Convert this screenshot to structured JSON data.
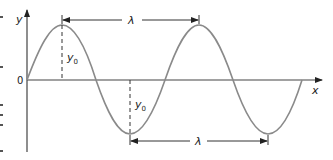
{
  "diagram": {
    "type": "transverse-wave",
    "axes": {
      "x_label": "x",
      "y_label": "y",
      "origin_label": "0"
    },
    "annotations": {
      "amplitude_top": {
        "symbol": "y",
        "subscript": "0"
      },
      "amplitude_bottom": {
        "symbol": "y",
        "subscript": "0"
      },
      "wavelength_top": "λ",
      "wavelength_bottom": "λ"
    },
    "colors": {
      "curve": "#8a8a8a",
      "axis": "#444444",
      "text": "#222222"
    }
  }
}
